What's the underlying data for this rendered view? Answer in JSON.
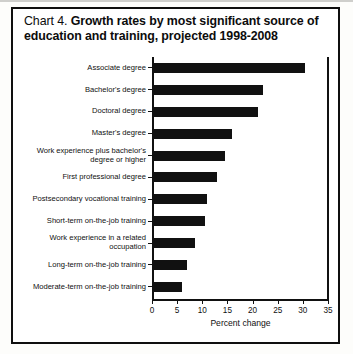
{
  "figure": {
    "title_lead": "Chart 4. ",
    "title_bold": "Growth rates by most significant source of education and training, projected 1998-2008"
  },
  "chart_data": {
    "type": "bar",
    "orientation": "horizontal",
    "title": "Chart 4. Growth rates by most significant source of education and training, projected 1998-2008",
    "xlabel": "Percent change",
    "ylabel": "",
    "xlim": [
      0,
      35
    ],
    "xticks": [
      0,
      5,
      10,
      15,
      20,
      25,
      30,
      35
    ],
    "grid": false,
    "legend": false,
    "bar_color": "#111111",
    "categories": [
      "Associate degree",
      "Bachelor's degree",
      "Doctoral degree",
      "Master's degree",
      "Work experience plus bachelor's\ndegree or higher",
      "First professional degree",
      "Postsecondary vocational training",
      "Short-term on-the-job training",
      "Work experience in a related\noccupation",
      "Long-term on-the-job training",
      "Moderate-term on-the-job training"
    ],
    "values": [
      30.5,
      22.0,
      21.0,
      16.0,
      14.5,
      13.0,
      11.0,
      10.5,
      8.5,
      7.0,
      6.0
    ]
  }
}
